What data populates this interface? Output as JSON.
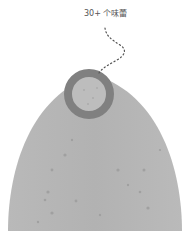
{
  "diagram": {
    "label": "30+ 个味蕾",
    "colors": {
      "background": "#ffffff",
      "tongue": "#b4b4b4",
      "tongue_dots": "#a2a2a2",
      "ring": "#7f7f7f",
      "ring_inner": "#bdbdbd",
      "leader_line": "#555555",
      "label_text": "#555555"
    }
  }
}
